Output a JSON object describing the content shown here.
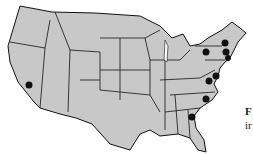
{
  "map": {
    "title": "United States map with marked locations",
    "land_color": "#c8c8c8",
    "border_color": "#111111",
    "marker_color": "#111111",
    "markers": [
      {
        "region": "California"
      },
      {
        "region": "New York (west)"
      },
      {
        "region": "Vermont / New Hampshire"
      },
      {
        "region": "Massachusetts"
      },
      {
        "region": "Connecticut / Rhode Island"
      },
      {
        "region": "Maryland / Delaware"
      },
      {
        "region": "Virginia / DC"
      },
      {
        "region": "North Carolina"
      },
      {
        "region": "Georgia"
      }
    ]
  },
  "caption": {
    "line1": "F",
    "line2": "ir"
  }
}
